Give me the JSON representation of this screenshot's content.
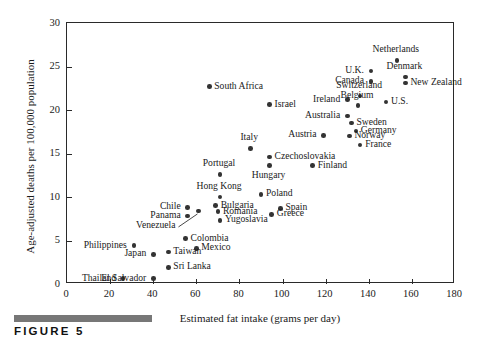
{
  "figure": {
    "caption_label": "FIGURE 5",
    "caption_bar_color": "#777777"
  },
  "chart_data": {
    "type": "scatter",
    "title": "",
    "xlabel": "Estimated fat intake (grams per day)",
    "ylabel": "Age-adjusted deaths per 100,000 population",
    "xlim": [
      0,
      180
    ],
    "ylim": [
      0,
      30
    ],
    "xticks": [
      0,
      20,
      40,
      60,
      80,
      100,
      120,
      140,
      160,
      180
    ],
    "yticks": [
      0,
      5,
      10,
      15,
      20,
      25,
      30
    ],
    "grid": false,
    "legend": "none",
    "point_color": "#333333",
    "points": [
      {
        "name": "Thailand",
        "x": 26,
        "y": 0.6,
        "label_pos": "left"
      },
      {
        "name": "El Salvador",
        "x": 40,
        "y": 0.6,
        "label_pos": "left"
      },
      {
        "name": "Sri Lanka",
        "x": 47,
        "y": 1.9,
        "label_pos": "right"
      },
      {
        "name": "Japan",
        "x": 40,
        "y": 3.4,
        "label_pos": "left"
      },
      {
        "name": "Taiwan",
        "x": 47,
        "y": 3.7,
        "label_pos": "right"
      },
      {
        "name": "Mexico",
        "x": 60,
        "y": 4.1,
        "label_pos": "right"
      },
      {
        "name": "Philippines",
        "x": 31,
        "y": 4.4,
        "label_pos": "left"
      },
      {
        "name": "Colombia",
        "x": 55,
        "y": 5.2,
        "label_pos": "right"
      },
      {
        "name": "Yugoslavia",
        "x": 71,
        "y": 7.3,
        "label_pos": "right"
      },
      {
        "name": "Venezuela",
        "x": 61,
        "y": 8.4,
        "label_pos": "leader"
      },
      {
        "name": "Panama",
        "x": 56,
        "y": 7.8,
        "label_pos": "left"
      },
      {
        "name": "Greece",
        "x": 95,
        "y": 8.0,
        "label_pos": "right"
      },
      {
        "name": "Romania",
        "x": 70,
        "y": 8.3,
        "label_pos": "right"
      },
      {
        "name": "Spain",
        "x": 99,
        "y": 8.7,
        "label_pos": "right"
      },
      {
        "name": "Chile",
        "x": 56,
        "y": 8.8,
        "label_pos": "left"
      },
      {
        "name": "Bulgaria",
        "x": 69,
        "y": 9.0,
        "label_pos": "right"
      },
      {
        "name": "Hong Kong",
        "x": 71,
        "y": 10.0,
        "label_pos": "above"
      },
      {
        "name": "Poland",
        "x": 90,
        "y": 10.3,
        "label_pos": "right"
      },
      {
        "name": "Portugal",
        "x": 71,
        "y": 12.6,
        "label_pos": "above"
      },
      {
        "name": "Hungary",
        "x": 94,
        "y": 13.6,
        "label_pos": "below"
      },
      {
        "name": "Finland",
        "x": 114,
        "y": 13.6,
        "label_pos": "right"
      },
      {
        "name": "Czechoslovakia",
        "x": 94,
        "y": 14.6,
        "label_pos": "right"
      },
      {
        "name": "Italy",
        "x": 85,
        "y": 15.6,
        "label_pos": "above"
      },
      {
        "name": "France",
        "x": 136,
        "y": 16.0,
        "label_pos": "right"
      },
      {
        "name": "Norway",
        "x": 131,
        "y": 17.0,
        "label_pos": "right"
      },
      {
        "name": "Austria",
        "x": 119,
        "y": 17.1,
        "label_pos": "left"
      },
      {
        "name": "Germany",
        "x": 134,
        "y": 17.6,
        "label_pos": "right"
      },
      {
        "name": "Sweden",
        "x": 132,
        "y": 18.5,
        "label_pos": "right"
      },
      {
        "name": "Australia",
        "x": 130,
        "y": 19.3,
        "label_pos": "left"
      },
      {
        "name": "Belgium",
        "x": 135,
        "y": 20.5,
        "label_pos": "above"
      },
      {
        "name": "Israel",
        "x": 94,
        "y": 20.6,
        "label_pos": "right"
      },
      {
        "name": "U.S.",
        "x": 148,
        "y": 20.9,
        "label_pos": "right"
      },
      {
        "name": "Ireland",
        "x": 130,
        "y": 21.2,
        "label_pos": "left"
      },
      {
        "name": "Switzerland",
        "x": 136,
        "y": 21.6,
        "label_pos": "above"
      },
      {
        "name": "South Africa",
        "x": 66,
        "y": 22.7,
        "label_pos": "right"
      },
      {
        "name": "New Zealand",
        "x": 157,
        "y": 23.1,
        "label_pos": "right"
      },
      {
        "name": "Canada",
        "x": 141,
        "y": 23.3,
        "label_pos": "left"
      },
      {
        "name": "Denmark",
        "x": 157,
        "y": 23.8,
        "label_pos": "above"
      },
      {
        "name": "U.K.",
        "x": 141,
        "y": 24.5,
        "label_pos": "left"
      },
      {
        "name": "Netherlands",
        "x": 153,
        "y": 25.7,
        "label_pos": "above"
      }
    ]
  }
}
